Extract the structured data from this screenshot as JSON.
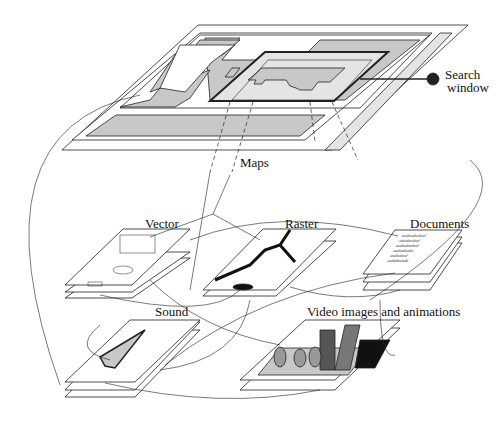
{
  "diagram": {
    "top_layer": {
      "label": "Maps"
    },
    "callout": {
      "line1": "Search",
      "line2": "window"
    },
    "layers": [
      {
        "id": "vector",
        "label": "Vector"
      },
      {
        "id": "raster",
        "label": "Raster"
      },
      {
        "id": "documents",
        "label": "Documents"
      },
      {
        "id": "sound",
        "label": "Sound"
      },
      {
        "id": "video",
        "label": "Video images and animations"
      }
    ],
    "document_lines": [
      "asdfasdasdasd",
      "sdasdasdasd",
      "asdasdasdasd",
      "asdasdasdas",
      "asdasdasd",
      "asdadasdsda"
    ],
    "colors": {
      "line": "#222222",
      "gray_fill": "#c8c8c8",
      "light_fill": "#e4e4e4",
      "dark_fill": "#555555",
      "black": "#111111"
    }
  }
}
